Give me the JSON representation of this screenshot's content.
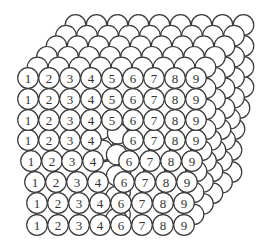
{
  "diagram": {
    "stroke_color": "#3a3a3a",
    "fill_color": "#ffffff",
    "circle_radius": 10.3,
    "back_layers": 5,
    "layer_offset": [
      9.5,
      -10.6
    ],
    "front_rows": [
      {
        "y": 78,
        "cells": [
          {
            "x": 28,
            "label": "1"
          },
          {
            "x": 49,
            "label": "2"
          },
          {
            "x": 70,
            "label": "3"
          },
          {
            "x": 91,
            "label": "4"
          },
          {
            "x": 112,
            "label": "5"
          },
          {
            "x": 133,
            "label": "6"
          },
          {
            "x": 154,
            "label": "7"
          },
          {
            "x": 175,
            "label": "8"
          },
          {
            "x": 196,
            "label": "9"
          }
        ]
      },
      {
        "y": 99,
        "cells": [
          {
            "x": 28,
            "label": "1"
          },
          {
            "x": 49,
            "label": "2"
          },
          {
            "x": 70,
            "label": "3"
          },
          {
            "x": 91,
            "label": "4"
          },
          {
            "x": 112,
            "label": "5"
          },
          {
            "x": 133,
            "label": "6"
          },
          {
            "x": 154,
            "label": "7"
          },
          {
            "x": 175,
            "label": "8"
          },
          {
            "x": 196,
            "label": "9"
          }
        ]
      },
      {
        "y": 120,
        "cells": [
          {
            "x": 28,
            "label": "1"
          },
          {
            "x": 49,
            "label": "2"
          },
          {
            "x": 70,
            "label": "3"
          },
          {
            "x": 91,
            "label": "4"
          },
          {
            "x": 112,
            "label": "5"
          },
          {
            "x": 133,
            "label": "6"
          },
          {
            "x": 154,
            "label": "7"
          },
          {
            "x": 175,
            "label": "8"
          },
          {
            "x": 196,
            "label": "9"
          }
        ]
      },
      {
        "y": 140,
        "cells": [
          {
            "x": 28,
            "label": "1"
          },
          {
            "x": 49,
            "label": "2"
          },
          {
            "x": 70,
            "label": "3"
          },
          {
            "x": 91,
            "label": "4"
          },
          {
            "x": 133,
            "label": "6"
          },
          {
            "x": 154,
            "label": "7"
          },
          {
            "x": 175,
            "label": "8"
          },
          {
            "x": 196,
            "label": "9"
          }
        ]
      },
      {
        "y": 161,
        "cells": [
          {
            "x": 31,
            "label": "1"
          },
          {
            "x": 52,
            "label": "2"
          },
          {
            "x": 72,
            "label": "3"
          },
          {
            "x": 93,
            "label": "4"
          },
          {
            "x": 129,
            "label": "6"
          },
          {
            "x": 150,
            "label": "7"
          },
          {
            "x": 171,
            "label": "8"
          },
          {
            "x": 192,
            "label": "9"
          }
        ]
      },
      {
        "y": 182,
        "cells": [
          {
            "x": 35,
            "label": "1"
          },
          {
            "x": 56,
            "label": "2"
          },
          {
            "x": 77,
            "label": "3"
          },
          {
            "x": 98,
            "label": "4"
          },
          {
            "x": 124,
            "label": "6"
          },
          {
            "x": 145,
            "label": "7"
          },
          {
            "x": 166,
            "label": "8"
          },
          {
            "x": 187,
            "label": "9"
          }
        ]
      },
      {
        "y": 203,
        "cells": [
          {
            "x": 37,
            "label": "1"
          },
          {
            "x": 58,
            "label": "2"
          },
          {
            "x": 79,
            "label": "3"
          },
          {
            "x": 100,
            "label": "4"
          },
          {
            "x": 121,
            "label": "6"
          },
          {
            "x": 142,
            "label": "7"
          },
          {
            "x": 163,
            "label": "8"
          },
          {
            "x": 184,
            "label": "9"
          }
        ]
      },
      {
        "y": 225,
        "cells": [
          {
            "x": 37,
            "label": "1"
          },
          {
            "x": 58,
            "label": "2"
          },
          {
            "x": 79,
            "label": "3"
          },
          {
            "x": 100,
            "label": "4"
          },
          {
            "x": 121,
            "label": "6"
          },
          {
            "x": 142,
            "label": "7"
          },
          {
            "x": 163,
            "label": "8"
          },
          {
            "x": 184,
            "label": "9"
          }
        ]
      }
    ]
  }
}
